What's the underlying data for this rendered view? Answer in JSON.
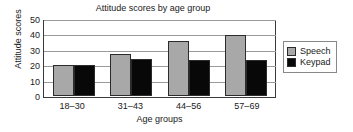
{
  "chart_data": {
    "type": "bar",
    "title": "Attitude scores by age group",
    "xlabel": "Age groups",
    "ylabel": "Attitude scores",
    "categories": [
      "18–30",
      "31–43",
      "44–56",
      "57–69"
    ],
    "series": [
      {
        "name": "Speech",
        "color": "#a8a8a8",
        "values": [
          20,
          27,
          35,
          39
        ]
      },
      {
        "name": "Keypad",
        "color": "#080808",
        "values": [
          20,
          24,
          23,
          23
        ]
      }
    ],
    "ylim": [
      0,
      50
    ],
    "yticks": [
      50,
      40,
      30,
      20,
      10,
      0
    ],
    "grid": true,
    "legend_position": "right"
  }
}
